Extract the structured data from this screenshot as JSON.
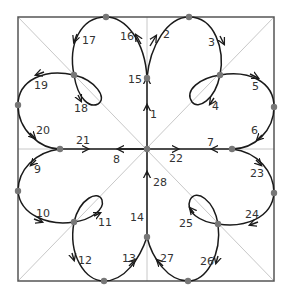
{
  "diagram": {
    "colors": {
      "border": "#555555",
      "guide": "#c8c8c8",
      "curve": "#1a1a1a",
      "node": "#777777",
      "label": "#333333"
    },
    "nodes": [
      {
        "id": "top-left",
        "x": 106,
        "y": 17
      },
      {
        "id": "top-right",
        "x": 189,
        "y": 17
      },
      {
        "id": "center-upper",
        "x": 147,
        "y": 78
      },
      {
        "id": "loop-tl",
        "x": 74,
        "y": 75
      },
      {
        "id": "loop-tr",
        "x": 220,
        "y": 75
      },
      {
        "id": "left-upper",
        "x": 18,
        "y": 105
      },
      {
        "id": "right-upper",
        "x": 274,
        "y": 107
      },
      {
        "id": "mid-left",
        "x": 60,
        "y": 149
      },
      {
        "id": "mid-right",
        "x": 232,
        "y": 149
      },
      {
        "id": "center",
        "x": 147,
        "y": 149
      },
      {
        "id": "left-lower",
        "x": 18,
        "y": 191
      },
      {
        "id": "right-lower",
        "x": 274,
        "y": 193
      },
      {
        "id": "loop-bl",
        "x": 74,
        "y": 222
      },
      {
        "id": "loop-br",
        "x": 218,
        "y": 224
      },
      {
        "id": "center-lower",
        "x": 147,
        "y": 237
      },
      {
        "id": "bottom-left",
        "x": 104,
        "y": 281
      },
      {
        "id": "bottom-right",
        "x": 188,
        "y": 281
      }
    ],
    "labels": [
      {
        "text": "1",
        "x": 150,
        "y": 118
      },
      {
        "text": "2",
        "x": 163,
        "y": 38
      },
      {
        "text": "3",
        "x": 208,
        "y": 46
      },
      {
        "text": "4",
        "x": 212,
        "y": 110
      },
      {
        "text": "5",
        "x": 252,
        "y": 90
      },
      {
        "text": "6",
        "x": 251,
        "y": 134
      },
      {
        "text": "7",
        "x": 207,
        "y": 146
      },
      {
        "text": "8",
        "x": 113,
        "y": 163
      },
      {
        "text": "9",
        "x": 34,
        "y": 173
      },
      {
        "text": "10",
        "x": 36,
        "y": 217
      },
      {
        "text": "11",
        "x": 98,
        "y": 226
      },
      {
        "text": "12",
        "x": 78,
        "y": 264
      },
      {
        "text": "13",
        "x": 122,
        "y": 262
      },
      {
        "text": "14",
        "x": 130,
        "y": 221
      },
      {
        "text": "15",
        "x": 128,
        "y": 83
      },
      {
        "text": "16",
        "x": 120,
        "y": 40
      },
      {
        "text": "17",
        "x": 82,
        "y": 44
      },
      {
        "text": "18",
        "x": 74,
        "y": 112
      },
      {
        "text": "19",
        "x": 34,
        "y": 89
      },
      {
        "text": "20",
        "x": 36,
        "y": 134
      },
      {
        "text": "21",
        "x": 76,
        "y": 144
      },
      {
        "text": "22",
        "x": 169,
        "y": 162
      },
      {
        "text": "23",
        "x": 250,
        "y": 177
      },
      {
        "text": "24",
        "x": 245,
        "y": 218
      },
      {
        "text": "25",
        "x": 179,
        "y": 227
      },
      {
        "text": "26",
        "x": 200,
        "y": 265
      },
      {
        "text": "27",
        "x": 160,
        "y": 262
      },
      {
        "text": "28",
        "x": 153,
        "y": 186
      }
    ]
  }
}
